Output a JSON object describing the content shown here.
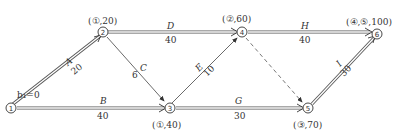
{
  "diagram": {
    "type": "network-shortest-path",
    "start_label": "b₁=0",
    "nodes": [
      {
        "id": "1",
        "label": "①",
        "mark": ""
      },
      {
        "id": "2",
        "label": "②",
        "mark": "(①,20)"
      },
      {
        "id": "3",
        "label": "③",
        "mark": "(①,40)"
      },
      {
        "id": "4",
        "label": "④",
        "mark": "(②,60)"
      },
      {
        "id": "5",
        "label": "⑤",
        "mark": "(③,70)"
      },
      {
        "id": "6",
        "label": "⑥",
        "mark": "(④,⑤,100)"
      }
    ],
    "edges": [
      {
        "from": "1",
        "to": "2",
        "name": "A",
        "weight": "20",
        "style": "double"
      },
      {
        "from": "1",
        "to": "3",
        "name": "B",
        "weight": "40",
        "style": "double"
      },
      {
        "from": "2",
        "to": "3",
        "name": "C",
        "weight": "6",
        "style": "single"
      },
      {
        "from": "2",
        "to": "4",
        "name": "D",
        "weight": "40",
        "style": "double"
      },
      {
        "from": "3",
        "to": "4",
        "name": "E",
        "weight": "10",
        "style": "single"
      },
      {
        "from": "3",
        "to": "5",
        "name": "G",
        "weight": "30",
        "style": "double"
      },
      {
        "from": "4",
        "to": "6",
        "name": "H",
        "weight": "40",
        "style": "double"
      },
      {
        "from": "5",
        "to": "6",
        "name": "I",
        "weight": "30",
        "style": "double"
      },
      {
        "from": "4",
        "to": "5",
        "name": "",
        "weight": "",
        "style": "dashed"
      }
    ]
  }
}
